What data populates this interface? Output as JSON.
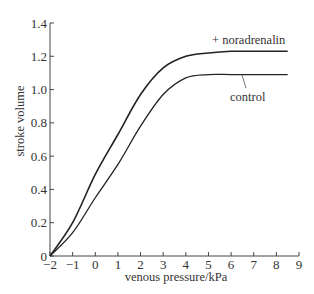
{
  "chart_data": {
    "type": "line",
    "title": "",
    "xlabel": "venous pressure/kPa",
    "ylabel": "stroke volume",
    "xlim": [
      -2,
      9
    ],
    "ylim": [
      0,
      1.4
    ],
    "grid": false,
    "legend": "none (inline annotations)",
    "x_ticks": [
      -2,
      -1,
      0,
      1,
      2,
      3,
      4,
      5,
      6,
      7,
      8,
      9
    ],
    "x_tick_labels": [
      "−2",
      "−1",
      "0",
      "1",
      "2",
      "3",
      "4",
      "5",
      "6",
      "7",
      "8",
      "9"
    ],
    "y_ticks": [
      0,
      0.2,
      0.4,
      0.6,
      0.8,
      1.0,
      1.2,
      1.4
    ],
    "y_tick_labels": [
      "0",
      "0.2",
      "0.4",
      "0.6",
      "0.8",
      "1.0",
      "1.2",
      "1.4"
    ],
    "x": [
      -2,
      -1,
      0,
      1,
      2,
      3,
      4,
      5,
      6,
      7,
      8,
      8.5
    ],
    "series": [
      {
        "name": "+ noradrenalin",
        "values": [
          0,
          0.2,
          0.49,
          0.73,
          0.97,
          1.13,
          1.2,
          1.22,
          1.23,
          1.23,
          1.23,
          1.23
        ]
      },
      {
        "name": "control",
        "values": [
          0,
          0.14,
          0.35,
          0.55,
          0.78,
          0.97,
          1.07,
          1.09,
          1.09,
          1.09,
          1.09,
          1.09
        ]
      }
    ],
    "annotations": [
      "+ noradrenalin",
      "control"
    ]
  }
}
